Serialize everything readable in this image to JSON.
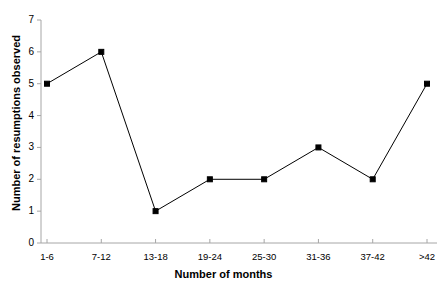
{
  "chart_data": {
    "type": "line",
    "title": "",
    "xlabel": "Number of months",
    "ylabel": "Number of resumptions observed",
    "categories": [
      "1-6",
      "7-12",
      "13-18",
      "19-24",
      "25-30",
      "31-36",
      "37-42",
      ">42"
    ],
    "values": [
      5,
      6,
      1,
      2,
      2,
      3,
      2,
      5
    ],
    "y_ticks": [
      0,
      1,
      2,
      3,
      4,
      5,
      6,
      7
    ],
    "ylim": [
      0,
      7
    ],
    "grid": false,
    "legend": null,
    "series_color": "#000000",
    "marker": "square",
    "axis_color": "#a6a6a6"
  },
  "axis": {
    "y_tick_labels": [
      "0",
      "1",
      "2",
      "3",
      "4",
      "5",
      "6",
      "7"
    ],
    "x_tick_labels": [
      "1-6",
      "7-12",
      "13-18",
      "19-24",
      "25-30",
      "31-36",
      "37-42",
      ">42"
    ],
    "y_title": "Number of resumptions observed",
    "x_title": "Number of months"
  }
}
